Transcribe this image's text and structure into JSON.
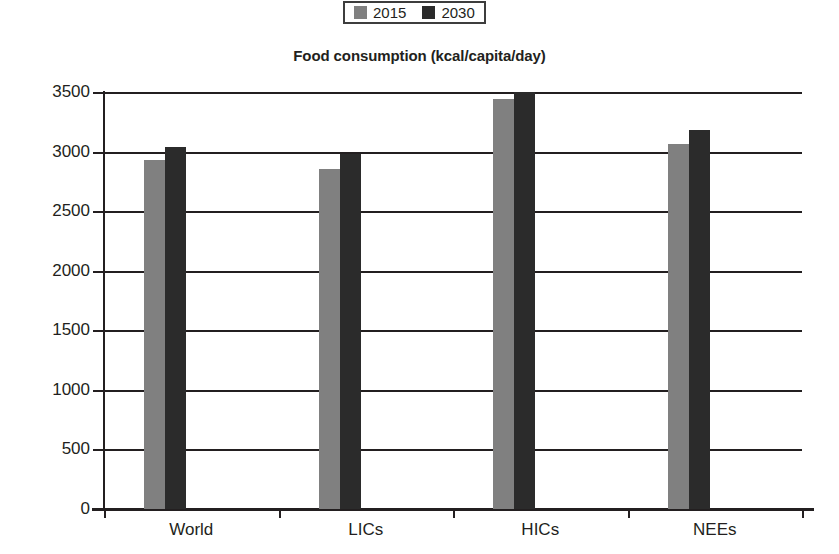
{
  "chart_data": {
    "type": "bar",
    "title": "Food consumption (kcal/capita/day)",
    "xlabel": "",
    "ylabel": "",
    "categories": [
      "World",
      "LICs",
      "HICs",
      "NEEs"
    ],
    "series": [
      {
        "name": "2015",
        "color": "#808080",
        "values": [
          2930,
          2850,
          3440,
          3060
        ]
      },
      {
        "name": "2030",
        "color": "#2b2b2b",
        "values": [
          3040,
          2980,
          3520,
          3180
        ]
      }
    ],
    "ylim": [
      0,
      3500
    ],
    "ytick_step": 500,
    "yticks": [
      3500,
      3000,
      2500,
      2000,
      1500,
      1000,
      500,
      0
    ],
    "ytick_labels": [
      "3500",
      "3000",
      "2500",
      "2000",
      "1500",
      "1000",
      "500",
      "0"
    ],
    "grid": true,
    "grid_axis": "y",
    "legend_position": "top-center",
    "note": "The 2030 bar for HICs is drawn clipped at the top of the plot area"
  },
  "legend": {
    "entries": [
      {
        "label": "2015",
        "swatch": "legend-swatch-2015",
        "color": "#808080"
      },
      {
        "label": "2030",
        "swatch": "legend-swatch-2030",
        "color": "#2b2b2b"
      }
    ]
  },
  "colors": {
    "axis": "#231f20",
    "grid": "#231f20",
    "background": "#ffffff",
    "series_2015": "#808080",
    "series_2030": "#2b2b2b"
  }
}
